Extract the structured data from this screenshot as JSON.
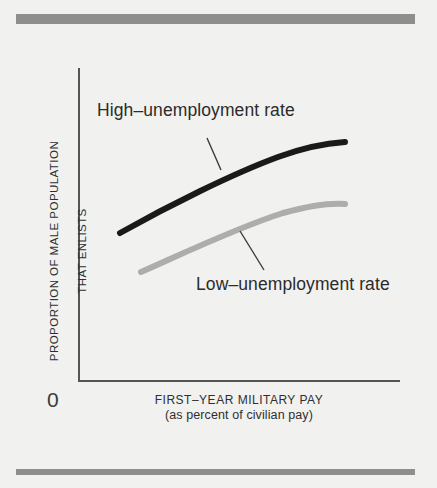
{
  "figure": {
    "background_color": "#f1f1ef",
    "rule_color": "#8e8e8e",
    "axis_color": "#555555"
  },
  "chart_data": {
    "type": "line",
    "title": "",
    "xlabel": "FIRST–YEAR MILITARY PAY",
    "xlabel_sub": "(as percent of civilian pay)",
    "ylabel_line1": "PROPORTION OF MALE POPULATION",
    "ylabel_line2": "THAT ENLISTS",
    "origin_tick": "0",
    "xlim": [
      0,
      100
    ],
    "ylim": [
      0,
      100
    ],
    "grid": false,
    "legend": "inline-annotations",
    "axis_ticks": {
      "x": [],
      "y": [
        "0"
      ]
    },
    "series": [
      {
        "name": "High–unemployment rate",
        "color": "#1a1a1a",
        "line_width": 6,
        "label_position": {
          "x": 97,
          "y": 100
        },
        "leader_line": {
          "x1": 207,
          "y1": 138,
          "x2": 221,
          "y2": 170
        },
        "path": "M 120 233 C 168 206, 232 174, 278 157 C 308 146, 330 143, 345 142",
        "x": [
          13,
          25,
          40,
          55,
          70,
          85,
          100
        ],
        "y": [
          47,
          56,
          65,
          72,
          77,
          80,
          81
        ]
      },
      {
        "name": "Low–unemployment rate",
        "color": "#adadad",
        "line_width": 6,
        "label_position": {
          "x": 196,
          "y": 274
        },
        "leader_line": {
          "x1": 240,
          "y1": 231,
          "x2": 264,
          "y2": 270
        },
        "path": "M 141 272 C 182 254, 236 228, 283 213 C 312 205, 332 203, 345 204",
        "x": [
          20,
          32,
          46,
          60,
          74,
          88,
          100
        ],
        "y": [
          35,
          43,
          51,
          57,
          61,
          63,
          63
        ]
      }
    ]
  }
}
